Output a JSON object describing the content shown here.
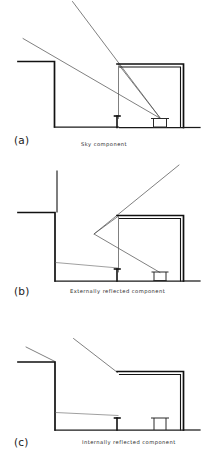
{
  "figure": {
    "background_color": "#ffffff",
    "ink_color": "#111111",
    "ray_color": "#555555",
    "width": 208,
    "height": 458
  },
  "panels": [
    {
      "id": "a",
      "label": "(a)",
      "caption": "Sky component",
      "description": "Direct light from the sky reaching the working plane through the window",
      "ray_count": 2,
      "rays": [
        {
          "name": "sky-ray-upper",
          "from": [
            83,
            2
          ],
          "to": [
            160,
            120
          ],
          "reflections": 0
        },
        {
          "name": "sky-ray-lower",
          "from": [
            23,
            38
          ],
          "to": [
            160,
            120
          ],
          "reflections": 0
        }
      ],
      "has_obstruction_building": true,
      "has_desk": true,
      "has_window": true
    },
    {
      "id": "b",
      "label": "(b)",
      "caption": "Externally reflected component",
      "description": "Light reflected from external surfaces before entering the window",
      "ray_count": 1,
      "rays": [
        {
          "name": "externally-reflected-ray",
          "from": [
            178,
            166
          ],
          "via": [
            94,
            234
          ],
          "to": [
            160,
            272
          ],
          "reflections": 1
        }
      ],
      "has_obstruction_building": true,
      "has_desk": true,
      "has_window": true,
      "has_pavement": true
    },
    {
      "id": "c",
      "label": "(c)",
      "caption": "Internally reflected component",
      "description": "Light reflected from internal room surfaces onto the working plane",
      "ray_count": 1,
      "rays": [
        {
          "name": "internally-reflected-ray",
          "from": [
            74,
            339
          ],
          "to": [
            117,
            372
          ],
          "reflections": 0
        }
      ],
      "has_obstruction_building": true,
      "has_desk": true,
      "has_window": true,
      "has_pavement": true
    }
  ]
}
